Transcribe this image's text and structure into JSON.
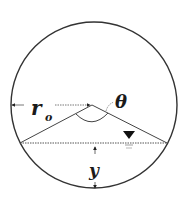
{
  "diagram": {
    "type": "partially-filled circular pipe cross-section",
    "labels": {
      "radius": "r",
      "radius_subscript": "o",
      "angle": "θ",
      "depth": "y"
    },
    "symbols": {
      "water_surface": "inverted-triangle-water-level-icon"
    },
    "colors": {
      "stroke": "#333333",
      "text": "#1a1a1a",
      "background": "#ffffff"
    }
  }
}
